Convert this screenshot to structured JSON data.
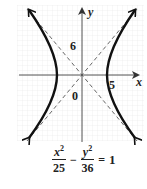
{
  "diagram": {
    "type": "hyperbola_graph",
    "axes": {
      "x_label": "x",
      "y_label": "y",
      "origin_label": "0",
      "x_tick_label": "5",
      "y_tick_label": "6"
    },
    "hyperbola": {
      "a": 5,
      "b": 6,
      "orientation": "horizontal",
      "vertices": [
        [
          -5,
          0
        ],
        [
          5,
          0
        ]
      ]
    },
    "asymptotes": [
      "y = 6/5 x",
      "y = -6/5 x"
    ],
    "colors": {
      "curve": "#111111",
      "axis": "#555555",
      "asymptote": "#666666",
      "grid": "#e3e3e3"
    }
  },
  "equation": {
    "term1_num_var": "x",
    "term1_num_exp": "2",
    "term1_den": "25",
    "operator": "−",
    "term2_num_var": "y",
    "term2_num_exp": "2",
    "term2_den": "36",
    "equals": "=",
    "rhs": "1"
  }
}
